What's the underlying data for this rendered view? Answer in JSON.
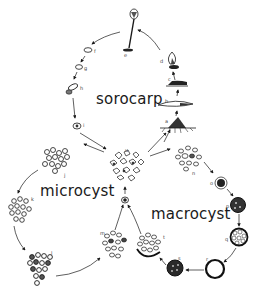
{
  "diagram": {
    "cycles": {
      "sorocarp": "sorocarp",
      "microcyst": "microcyst",
      "macrocyst": "macrocyst"
    },
    "stage_labels": {
      "a": "a",
      "b": "b",
      "c": "c",
      "d": "d",
      "e": "e",
      "f": "f",
      "g": "g",
      "h": "h",
      "i": "i",
      "j": "j",
      "k": "k",
      "l": "l",
      "m": "m",
      "n": "n",
      "o": "o",
      "p": "p",
      "q": "q",
      "r": "r",
      "s": "s",
      "t": "t",
      "u": "u"
    },
    "colors": {
      "ink": "#1a1a1a",
      "background": "#ffffff"
    }
  }
}
